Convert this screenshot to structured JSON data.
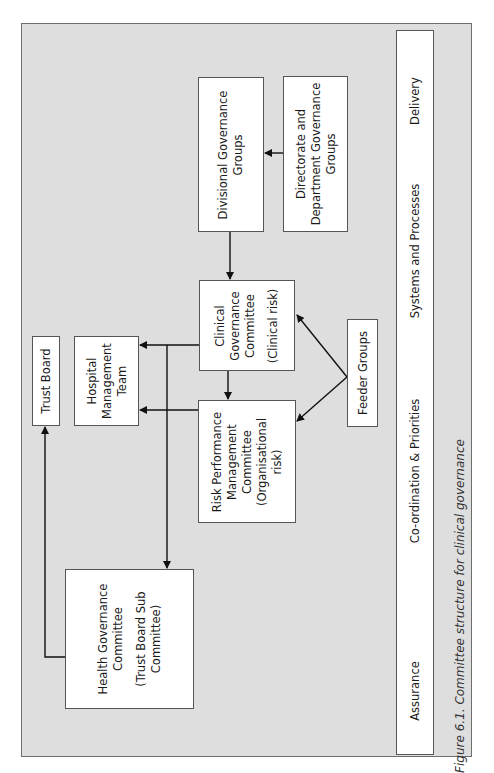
{
  "diagram": {
    "nodes": {
      "trust_board": {
        "lines": [
          "Trust Board"
        ]
      },
      "hospital_management": {
        "lines": [
          "Hospital",
          "Management",
          "Team"
        ]
      },
      "health_governance": {
        "lines": [
          "Health Governance",
          "Committee"
        ],
        "sub": [
          "(Trust Board Sub",
          "Committee)"
        ]
      },
      "risk_performance": {
        "lines": [
          "Risk Performance",
          "Management",
          "Committee",
          "(Organisational",
          "risk)"
        ]
      },
      "clinical_governance": {
        "lines": [
          "Clinical",
          "Governance",
          "Committee"
        ],
        "sub": [
          "(Clinical risk)"
        ]
      },
      "feeder_groups": {
        "lines": [
          "Feeder Groups"
        ]
      },
      "divisional_governance": {
        "lines": [
          "Divisional Governance",
          "Groups"
        ]
      },
      "directorate_department": {
        "lines": [
          "Directorate and",
          "Department Governance",
          "Groups"
        ]
      }
    },
    "edges": [
      {
        "from": "directorate_department",
        "to": "divisional_governance"
      },
      {
        "from": "divisional_governance",
        "to": "clinical_governance"
      },
      {
        "from": "clinical_governance",
        "to": "risk_performance"
      },
      {
        "from": "clinical_governance",
        "to": "hospital_management"
      },
      {
        "from": "risk_performance",
        "to": "hospital_management"
      },
      {
        "from": "clinical_governance",
        "to": "health_governance"
      },
      {
        "from": "health_governance",
        "to": "trust_board"
      },
      {
        "from": "feeder_groups",
        "to": "clinical_governance"
      },
      {
        "from": "feeder_groups",
        "to": "risk_performance"
      }
    ],
    "band": {
      "labels": [
        "Delivery",
        "Systems and Processes",
        "Co-ordination & Priorities",
        "Assurance"
      ]
    },
    "caption": "Figure 6.1. Committee structure for clinical governance"
  }
}
